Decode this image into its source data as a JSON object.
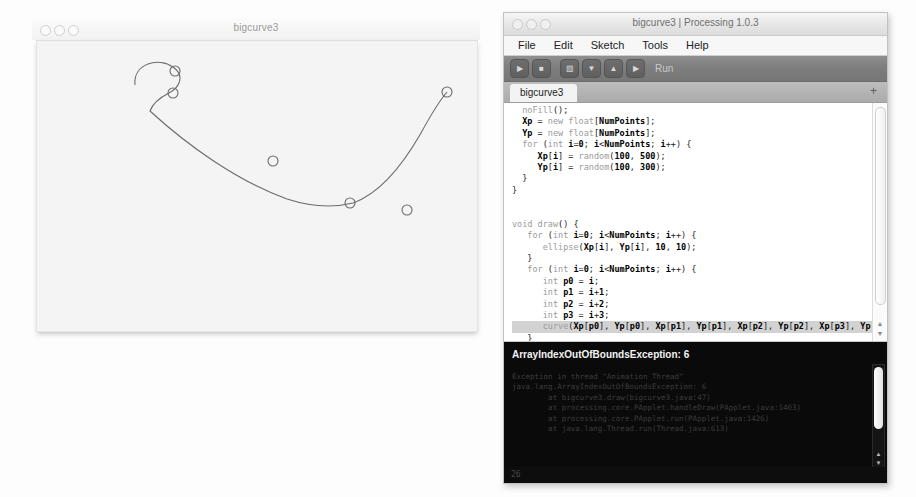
{
  "sketch_window": {
    "title": "bigcurve3",
    "traffic_lights": [
      "close",
      "minimize",
      "zoom"
    ],
    "canvas": {
      "background": "#f4f4f4",
      "stroke_color": "#6b6b6b",
      "point_radius": 5,
      "points": [
        {
          "x": 138,
          "y": 30
        },
        {
          "x": 136,
          "y": 52
        },
        {
          "x": 236,
          "y": 120
        },
        {
          "x": 313,
          "y": 162
        },
        {
          "x": 370,
          "y": 169
        },
        {
          "x": 410,
          "y": 51
        }
      ],
      "curve_path": "M 98,44 C 96,22 122,16 136,26 C 150,36 140,48 132,52 C 124,56 116,62 113,70 C 150,104 200,140 250,158 C 278,167 300,166 316,162 C 344,152 368,120 384,92 C 396,70 404,58 410,51"
    }
  },
  "pde_window": {
    "title": "bigcurve3 | Processing 1.0.3",
    "traffic_lights": [
      "close",
      "minimize",
      "zoom"
    ],
    "menubar": [
      "File",
      "Edit",
      "Sketch",
      "Tools",
      "Help"
    ],
    "toolbar": {
      "buttons": [
        {
          "name": "run",
          "glyph": "▶"
        },
        {
          "name": "stop",
          "glyph": "■"
        },
        {
          "name": "new",
          "glyph": "▧"
        },
        {
          "name": "open",
          "glyph": "▼"
        },
        {
          "name": "save",
          "glyph": "▲"
        },
        {
          "name": "export",
          "glyph": "▶"
        }
      ],
      "run_label": "Run"
    },
    "tabbar": {
      "tab_label": "bigcurve3",
      "add_glyph": "+"
    },
    "code_lines": [
      "  noFill();",
      "  Xp = new float[NumPoints];",
      "  Yp = new float[NumPoints];",
      "  for (int i=0; i<NumPoints; i++) {",
      "     Xp[i] = random(100, 500);",
      "     Yp[i] = random(100, 300);",
      "  }",
      "}",
      "",
      "",
      "void draw() {",
      "   for (int i=0; i<NumPoints; i++) {",
      "      ellipse(Xp[i], Yp[i], 10, 10);",
      "   }",
      "   for (int i=0; i<NumPoints; i++) {",
      "      int p0 = i;",
      "      int p1 = i+1;",
      "      int p2 = i+2;",
      "      int p3 = i+3;",
      "      curve(Xp[p0], Yp[p0], Xp[p1], Yp[p1], Xp[p2], Yp[p2], Xp[p3], Yp[p3]);",
      "   }",
      "}"
    ],
    "selected_line_index": 19,
    "console": {
      "error": "ArrayIndexOutOfBoundsException: 6",
      "stack_trace": [
        "Exception in thread \"Animation Thread\"",
        "java.lang.ArrayIndexOutOfBoundsException: 6",
        "        at bigcurve3.draw(bigcurve3.java:47)",
        "        at processing.core.PApplet.handleDraw(PApplet.java:1403)",
        "        at processing.core.PApplet.run(PApplet.java:1426)",
        "        at java.lang.Thread.run(Thread.java:613)"
      ]
    },
    "statusbar": {
      "line_number": "26"
    },
    "scrollbar_arrows": {
      "up": "▲",
      "down": "▼"
    }
  }
}
